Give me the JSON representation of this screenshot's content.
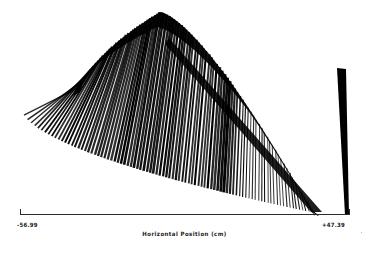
{
  "figure": {
    "title_visible": false,
    "background_color": "#ffffff",
    "ink_color": "#000000"
  },
  "axis": {
    "line_y": 214,
    "left_tick_x": 20,
    "right_tick_x": 350,
    "tick_height": 5,
    "left_label": "-56.99",
    "right_label": "+47.39",
    "caption": "Horizontal Position (cm)"
  },
  "chart_data": {
    "type": "line",
    "title": "",
    "subtitle": "",
    "xlabel": "Horizontal Position (cm)",
    "ylabel": "",
    "xlim": [
      -56.99,
      47.39
    ],
    "xticks": [
      -56.99,
      47.39
    ],
    "xticklabels": [
      "-56.99",
      "+47.39"
    ],
    "yticks": [],
    "yticklabels": [],
    "grid": false,
    "legend": null,
    "annotations": [],
    "render": {
      "plot_left": 20,
      "plot_right": 350,
      "plot_top": 10,
      "plot_bottom": 214,
      "trace_count": 92,
      "trace_color": "#000000",
      "apex_x": 131,
      "apex_y": 12,
      "left_terminus_x": 22,
      "left_terminus_y": 92,
      "right_terminus_x": 320,
      "right_terminus_y": 214,
      "dark_band_start_x": 208,
      "dark_band_end_x": 244,
      "isolated_wedge": {
        "top_x": 337,
        "top_y": 68,
        "bottom_x": 345,
        "bottom_y": 215,
        "top_width": 9,
        "bottom_width": 4
      }
    },
    "series": [
      {
        "name": "wiggle-traces",
        "note": "Each trace is a near-vertical seismic amplitude wiggle. Geometry is generated parametrically from the render block: top envelope rises steeply from the left terminus to the apex then falls to the right terminus; bottom envelope is a curved arc.",
        "values": []
      }
    ]
  }
}
